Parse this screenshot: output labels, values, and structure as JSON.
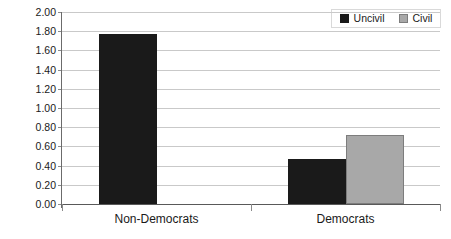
{
  "chart_data": {
    "type": "bar",
    "title": "",
    "subtitle": "",
    "xlabel": "",
    "ylabel": "",
    "categories": [
      "Non-Democrats",
      "Democrats"
    ],
    "series": [
      {
        "name": "Uncivil",
        "color": "#1a1a1a",
        "values": [
          1.77,
          0.47
        ]
      },
      {
        "name": "Civil",
        "color": "#a8a8a8",
        "values": [
          0.0,
          0.72
        ]
      }
    ],
    "ylim": [
      0.0,
      2.0
    ],
    "ytick_step": 0.2,
    "ytick_labels": [
      "0.00",
      "0.20",
      "0.40",
      "0.60",
      "0.80",
      "1.00",
      "1.20",
      "1.40",
      "1.60",
      "1.80",
      "2.00"
    ],
    "ytick_values": [
      0.0,
      0.2,
      0.4,
      0.6,
      0.8,
      1.0,
      1.2,
      1.4,
      1.6,
      1.8,
      2.0
    ],
    "grid": true,
    "grid_axis": "y",
    "legend_position": "top-right",
    "legend_entries": [
      "Uncivil",
      "Civil"
    ],
    "background_color": "#ffffff",
    "gridline_color": "#c9c9c9",
    "axis_color": "#6b6b6b"
  }
}
